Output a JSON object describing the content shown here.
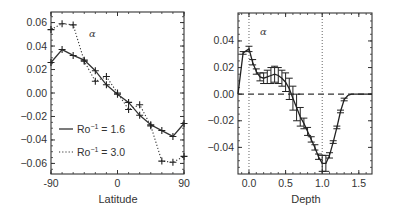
{
  "chart_data": [
    {
      "type": "line",
      "panel": "left",
      "title": "",
      "annotation": "α",
      "xlabel": "Latitude",
      "ylabel": "",
      "xlim": [
        -90,
        90
      ],
      "ylim": [
        -0.069,
        0.069
      ],
      "xticks": [
        -90,
        0,
        90
      ],
      "xtick_labels": [
        "-90",
        "0",
        "90"
      ],
      "yticks": [
        0.06,
        0.04,
        0.02,
        0.0,
        -0.02,
        -0.04,
        -0.06
      ],
      "ytick_labels": [
        "0.06",
        "0.04",
        "0.02",
        "0.00",
        "−0.02",
        "−0.04",
        "−0.06"
      ],
      "grid": false,
      "legend_position": "lower left",
      "x": [
        -90,
        -75,
        -60,
        -45,
        -30,
        -15,
        0,
        15,
        30,
        45,
        60,
        75,
        90
      ],
      "series": [
        {
          "name": "Ro⁻¹ = 1.6",
          "legend_label_base": "Ro",
          "legend_label_sup": "−1",
          "legend_label_value": " = 1.6",
          "style": "solid",
          "marker": "+",
          "values": [
            0.026,
            0.037,
            0.032,
            0.028,
            0.019,
            0.007,
            -0.001,
            -0.008,
            -0.019,
            -0.027,
            -0.032,
            -0.037,
            -0.026
          ]
        },
        {
          "name": "Ro⁻¹ = 3.0",
          "legend_label_base": "Ro",
          "legend_label_sup": "−1",
          "legend_label_value": " = 3.0",
          "style": "dotted",
          "marker": "+",
          "values": [
            0.054,
            0.059,
            0.058,
            0.027,
            0.01,
            0.014,
            0.0,
            -0.014,
            -0.01,
            -0.028,
            -0.058,
            -0.059,
            -0.054
          ]
        }
      ]
    },
    {
      "type": "line",
      "panel": "right",
      "title": "",
      "annotation": "α",
      "xlabel": "Depth",
      "ylabel": "",
      "xlim": [
        -0.15,
        1.68
      ],
      "ylim": [
        -0.06,
        0.061
      ],
      "xticks": [
        0.0,
        0.5,
        1.0,
        1.5
      ],
      "xtick_labels": [
        "0.0",
        "0.5",
        "1.0",
        "1.5"
      ],
      "yticks": [
        0.04,
        0.02,
        0.0,
        -0.02,
        -0.04
      ],
      "ytick_labels": [
        "0.04",
        "0.02",
        "0.00",
        "−0.02",
        "−0.04"
      ],
      "grid": false,
      "reference_lines": {
        "horizontal_dashed": 0.0,
        "vertical_dotted": [
          0.0,
          1.0
        ]
      },
      "series": [
        {
          "name": "α profile",
          "style": "solid",
          "error_bars": true,
          "x": [
            -0.15,
            -0.08,
            0.0,
            0.05,
            0.1,
            0.15,
            0.2,
            0.25,
            0.3,
            0.35,
            0.4,
            0.45,
            0.5,
            0.55,
            0.6,
            0.65,
            0.7,
            0.75,
            0.8,
            0.85,
            0.9,
            0.95,
            1.0,
            1.05,
            1.1,
            1.15,
            1.2,
            1.25,
            1.3,
            1.35,
            1.4,
            1.5,
            1.68
          ],
          "values": [
            0.0,
            0.031,
            0.034,
            0.024,
            0.017,
            0.013,
            0.012,
            0.013,
            0.014,
            0.015,
            0.014,
            0.012,
            0.009,
            0.004,
            -0.003,
            -0.01,
            -0.017,
            -0.022,
            -0.028,
            -0.034,
            -0.04,
            -0.047,
            -0.052,
            -0.052,
            -0.046,
            -0.036,
            -0.025,
            -0.013,
            -0.004,
            -0.001,
            0.0,
            0.0,
            0.0
          ],
          "errors": [
            0.0,
            0.001,
            0.002,
            0.002,
            0.002,
            0.003,
            0.004,
            0.005,
            0.006,
            0.006,
            0.006,
            0.006,
            0.007,
            0.008,
            0.009,
            0.01,
            0.007,
            0.004,
            0.003,
            0.002,
            0.002,
            0.002,
            0.006,
            0.006,
            0.002,
            0.001,
            0.001,
            0.001,
            0.001,
            0.0,
            0.0,
            0.0,
            0.0
          ]
        }
      ]
    }
  ]
}
